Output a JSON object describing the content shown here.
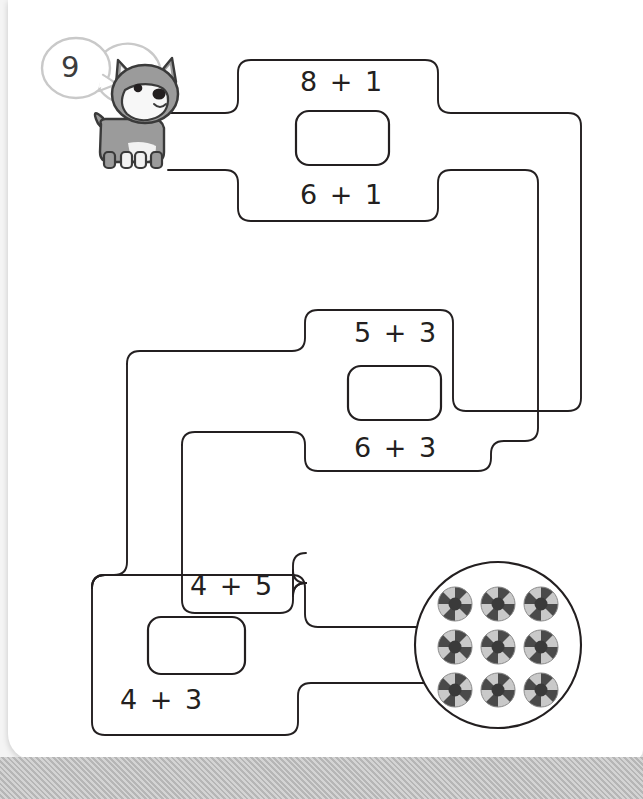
{
  "worksheet": {
    "title_strip": "—  ——  — — —  —— ——  — —— ——  — —",
    "target_number": "9",
    "character": "dog",
    "goal_count": 9
  },
  "groups": [
    {
      "id": "group-1",
      "top_equation": "8 + 1",
      "bottom_equation": "6 + 1",
      "answer_value": "",
      "answer_placeholder": ""
    },
    {
      "id": "group-2",
      "top_equation": "5 + 3",
      "bottom_equation": "6 + 3",
      "answer_value": "",
      "answer_placeholder": ""
    },
    {
      "id": "group-3",
      "top_equation": "4 + 5",
      "bottom_equation": "4 + 3",
      "answer_value": "",
      "answer_placeholder": ""
    }
  ],
  "goal": {
    "label": "9 balls",
    "balls": [
      "ball-1",
      "ball-2",
      "ball-3",
      "ball-4",
      "ball-5",
      "ball-6",
      "ball-7",
      "ball-8",
      "ball-9"
    ]
  },
  "colors": {
    "ink": "#231f20",
    "dog_body": "#9b9b9b",
    "dog_outline": "#3a3a3a",
    "bubble_outline": "#c9c9c9",
    "ball_dark": "#4a4a4a",
    "ball_light": "#c9c9c9",
    "ball_center": "#3a3a3a",
    "page": "#ffffff",
    "backdrop": "#bdbdbd"
  }
}
